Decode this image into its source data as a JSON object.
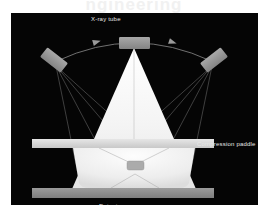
{
  "watermark": {
    "text": "ngineering"
  },
  "figure": {
    "type": "schematic-diagram",
    "background_color": "#050505",
    "panel": {
      "x": 11,
      "y": 13,
      "width": 247,
      "height": 192
    },
    "labels": {
      "tube": "X-ray tube",
      "paddle": "Compression paddle",
      "detector": "Detector"
    },
    "colors": {
      "background": "#050505",
      "tube_body": "#9a9a9a",
      "beam_cone": "#f2f2f2",
      "breast": "#ededed",
      "lesion": "#a9a9a9",
      "paddle": "#d8d8d8",
      "detector": "#8c8c8c",
      "ray_line": "#6f6f6f",
      "arc": "#777777",
      "label_text": "#e8e8e8"
    },
    "components": [
      {
        "name": "x-ray-tube-left",
        "kind": "tube",
        "position": "left",
        "x": 30,
        "y": 42,
        "width": 26,
        "height": 11,
        "rotation_deg": 38
      },
      {
        "name": "x-ray-tube-center",
        "kind": "tube",
        "position": "center",
        "x": 108,
        "y": 24,
        "width": 30,
        "height": 11,
        "rotation_deg": 0
      },
      {
        "name": "x-ray-tube-right",
        "kind": "tube",
        "position": "right",
        "x": 190,
        "y": 42,
        "width": 26,
        "height": 11,
        "rotation_deg": -38
      },
      {
        "name": "sweep-arc",
        "kind": "arc",
        "description": "tube travel arc with directional arrowheads",
        "arrow_count": 2,
        "arrow_direction": "left-to-right"
      },
      {
        "name": "beam-cone",
        "kind": "cone",
        "apex_x": 123,
        "apex_y": 35,
        "base_y": 176,
        "base_half_width": 62
      },
      {
        "name": "compression-paddle",
        "kind": "bar",
        "x": 21,
        "y": 126,
        "width": 182,
        "height": 9
      },
      {
        "name": "detector",
        "kind": "bar",
        "x": 21,
        "y": 175,
        "width": 182,
        "height": 10
      },
      {
        "name": "compressed-breast",
        "kind": "tissue",
        "top_y": 135,
        "bottom_y": 175
      },
      {
        "name": "lesion",
        "kind": "marker",
        "x": 116,
        "y": 152,
        "width": 16,
        "height": 9
      }
    ],
    "ray_paths": [
      {
        "from": "x-ray-tube-left",
        "count": 4
      },
      {
        "from": "x-ray-tube-center",
        "count": 2
      },
      {
        "from": "x-ray-tube-right",
        "count": 4
      }
    ]
  }
}
